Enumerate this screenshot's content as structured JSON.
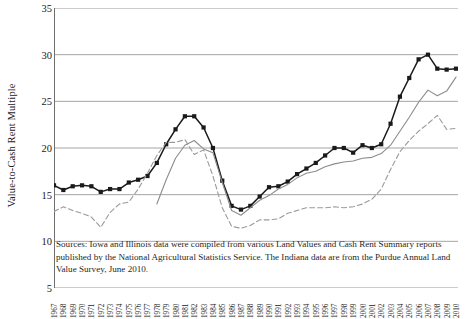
{
  "chart_data": {
    "type": "line",
    "title": "",
    "xlabel": "",
    "ylabel": "Value-to-Cash Rent Multiple",
    "ylim": [
      5,
      35
    ],
    "yticks": [
      5,
      10,
      15,
      20,
      25,
      30,
      35
    ],
    "grid": true,
    "legend_position": "none",
    "x": [
      1967,
      1968,
      1969,
      1970,
      1971,
      1972,
      1973,
      1974,
      1975,
      1976,
      1977,
      1978,
      1979,
      1980,
      1981,
      1982,
      1983,
      1984,
      1985,
      1986,
      1987,
      1988,
      1989,
      1990,
      1991,
      1992,
      1993,
      1994,
      1995,
      1996,
      1997,
      1998,
      1999,
      2000,
      2001,
      2002,
      2003,
      2004,
      2005,
      2006,
      2007,
      2008,
      2009,
      2010
    ],
    "categories": [
      "1967",
      "1968",
      "1969",
      "1970",
      "1971",
      "1972",
      "1973",
      "1974",
      "1975",
      "1976",
      "1977",
      "1978",
      "1979",
      "1980",
      "1981",
      "1982",
      "1983",
      "1984",
      "1985",
      "1986",
      "1987",
      "1988",
      "1989",
      "1990",
      "1991",
      "1992",
      "1993",
      "1994",
      "1995",
      "1996",
      "1997",
      "1998",
      "1999",
      "2000",
      "2001",
      "2002",
      "2003",
      "2004",
      "2005",
      "2006",
      "2007",
      "2008",
      "2009",
      "2010"
    ],
    "series": [
      {
        "name": "Indiana",
        "style": "solid-square-marker",
        "color": "#1a1a1a",
        "marker": "square",
        "values": [
          16.0,
          15.5,
          15.9,
          16.0,
          15.9,
          15.3,
          15.6,
          15.6,
          16.3,
          16.6,
          17.0,
          18.4,
          20.4,
          22.0,
          23.4,
          23.4,
          22.2,
          20.0,
          16.5,
          13.8,
          13.4,
          13.8,
          14.8,
          15.8,
          15.9,
          16.4,
          17.2,
          17.8,
          18.4,
          19.2,
          20.0,
          20.0,
          19.5,
          20.3,
          20.0,
          20.4,
          22.6,
          25.5,
          27.5,
          29.5,
          30.0,
          28.5,
          28.4,
          28.5
        ]
      },
      {
        "name": "Illinois",
        "style": "solid-thin",
        "color": "#8c8c8c",
        "marker": "none",
        "values": [
          null,
          null,
          null,
          null,
          null,
          null,
          null,
          null,
          null,
          null,
          null,
          14.0,
          16.6,
          18.9,
          20.3,
          20.8,
          19.9,
          19.5,
          16.3,
          13.3,
          12.8,
          13.6,
          14.4,
          14.9,
          15.6,
          16.1,
          16.8,
          17.3,
          17.5,
          18.0,
          18.3,
          18.5,
          18.6,
          18.9,
          19.0,
          19.4,
          20.3,
          21.8,
          23.3,
          24.9,
          26.2,
          25.6,
          26.1,
          27.6
        ]
      },
      {
        "name": "Iowa",
        "style": "dashed",
        "color": "#9a9a9a",
        "marker": "none",
        "values": [
          13.2,
          13.7,
          13.3,
          13.0,
          12.6,
          11.5,
          13.1,
          14.0,
          14.2,
          15.6,
          17.3,
          19.2,
          20.6,
          20.6,
          20.9,
          19.3,
          19.8,
          17.0,
          13.6,
          11.6,
          11.4,
          11.7,
          12.3,
          12.3,
          12.4,
          13.0,
          13.3,
          13.6,
          13.6,
          13.6,
          13.7,
          13.6,
          13.7,
          14.0,
          14.5,
          15.6,
          17.7,
          19.6,
          20.8,
          21.8,
          22.6,
          23.5,
          22.0,
          22.1
        ]
      }
    ],
    "note": "Sources: Iowa and Illinois data were compiled from various Land Values and Cash Rent Summary reports published by the National Agricultural Statistics Service. The Indiana data are from the Purdue Annual Land Value Survey, June 2010."
  }
}
